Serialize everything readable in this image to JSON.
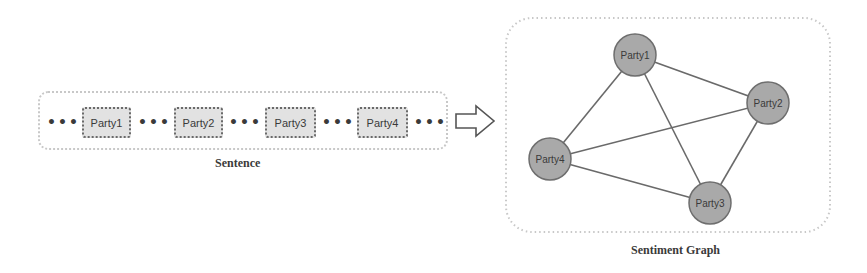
{
  "sentence": {
    "caption": "Sentence",
    "ellipsis": "•••",
    "parties": [
      {
        "label": "Party1"
      },
      {
        "label": "Party2"
      },
      {
        "label": "Party3"
      },
      {
        "label": "Party4"
      }
    ]
  },
  "arrow": {
    "icon": "right-arrow-icon"
  },
  "graph": {
    "caption": "Sentiment Graph",
    "nodes": [
      {
        "id": "Party1",
        "label": "Party1",
        "x": 635,
        "y": 55
      },
      {
        "id": "Party2",
        "label": "Party2",
        "x": 768,
        "y": 103
      },
      {
        "id": "Party3",
        "label": "Party3",
        "x": 710,
        "y": 203
      },
      {
        "id": "Party4",
        "label": "Party4",
        "x": 550,
        "y": 159
      }
    ],
    "edges": [
      [
        "Party1",
        "Party2"
      ],
      [
        "Party1",
        "Party3"
      ],
      [
        "Party1",
        "Party4"
      ],
      [
        "Party2",
        "Party3"
      ],
      [
        "Party2",
        "Party4"
      ],
      [
        "Party3",
        "Party4"
      ]
    ]
  },
  "colors": {
    "node_fill": "#a9a9a9",
    "node_stroke": "#6e6e6e",
    "edge": "#6a6a6a",
    "party_box_fill": "#e2e2e2",
    "text": "#3a3a3a"
  }
}
